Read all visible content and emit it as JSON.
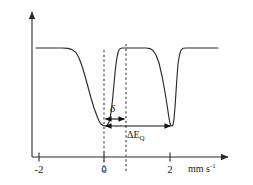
{
  "figure": {
    "background_color": "#ffffff",
    "line_color": "#2b2b2b"
  },
  "axes": {
    "x_axis": {
      "name": "velocity-axis",
      "unit_label_main": "mm s",
      "unit_label_exponent": "-1",
      "ticks": [
        {
          "value": -2,
          "label": "-2",
          "px": 39
        },
        {
          "value": 0,
          "label": "0",
          "px": 104
        },
        {
          "value": 2,
          "label": "2",
          "px": 170
        }
      ],
      "range": [
        -2.9,
        3.6
      ],
      "baseline_y_px": 157
    },
    "y_axis": {
      "name": "transmission-axis",
      "label": "",
      "ticks": [],
      "arrow": true,
      "x_px": 32,
      "top_y_px": 10
    }
  },
  "annotations": {
    "isomer_shift": {
      "symbol": "δ",
      "name": "isomer-shift",
      "arrow_from_px": 104,
      "arrow_to_px": 126,
      "arrow_y_px": 119,
      "label_x_px": 112,
      "label_y_px": 104
    },
    "quadrupole_splitting": {
      "symbol_main": "ΔE",
      "symbol_sub": "Q",
      "name": "quadrupole-splitting",
      "arrow_from_px": 104,
      "arrow_to_px": 172,
      "arrow_y_px": 126,
      "label_x_px": 128,
      "label_y_px": 131
    },
    "guide_lines": [
      {
        "name": "guide-line-zero",
        "x_px": 104,
        "top_y_px": 50,
        "bottom_y_px": 172
      },
      {
        "name": "guide-line-centroid",
        "x_px": 126,
        "top_y_px": 44,
        "bottom_y_px": 172
      }
    ]
  },
  "chart_data": {
    "type": "line",
    "xlabel": "mm s-1",
    "ylabel": "",
    "xlim": [
      -2.9,
      3.6
    ],
    "ylim": [
      0,
      1
    ],
    "grid": false,
    "legend": null,
    "series": [
      {
        "name": "transmission",
        "baseline_level": 1.0,
        "peaks": [
          {
            "name": "left-absorption-line",
            "center_mm_s": -0.05,
            "depth": 0.72,
            "width_mm_s": 0.62
          },
          {
            "name": "right-absorption-line",
            "center_mm_s": 2.0,
            "depth": 0.72,
            "width_mm_s": 0.36
          }
        ],
        "points_px": [
          [
            36,
            48
          ],
          [
            52,
            48
          ],
          [
            62,
            48
          ],
          [
            68,
            48.4
          ],
          [
            72,
            49.6
          ],
          [
            76,
            52.5
          ],
          [
            79,
            58
          ],
          [
            82,
            66
          ],
          [
            85,
            76
          ],
          [
            88,
            87
          ],
          [
            91,
            98
          ],
          [
            94,
            108
          ],
          [
            97,
            116
          ],
          [
            99,
            121
          ],
          [
            101,
            124
          ],
          [
            103,
            125.5
          ],
          [
            105,
            126
          ],
          [
            107,
            125.5
          ],
          [
            109,
            122
          ],
          [
            111,
            113
          ],
          [
            112.5,
            100
          ],
          [
            114,
            84
          ],
          [
            115.5,
            68
          ],
          [
            117,
            57
          ],
          [
            118.5,
            51
          ],
          [
            120,
            48.8
          ],
          [
            122,
            48
          ],
          [
            126,
            48
          ],
          [
            140,
            48
          ],
          [
            146,
            48
          ],
          [
            150,
            48.6
          ],
          [
            153,
            50.6
          ],
          [
            156,
            55
          ],
          [
            159,
            63
          ],
          [
            162,
            76
          ],
          [
            165,
            92
          ],
          [
            167.5,
            108
          ],
          [
            169,
            118
          ],
          [
            170,
            123.5
          ],
          [
            171,
            125.8
          ],
          [
            172,
            126
          ],
          [
            173,
            125
          ],
          [
            174,
            119
          ],
          [
            175,
            107
          ],
          [
            176,
            92
          ],
          [
            177,
            77
          ],
          [
            178,
            64
          ],
          [
            179.5,
            55
          ],
          [
            181,
            50.2
          ],
          [
            183,
            48.3
          ],
          [
            186,
            48
          ],
          [
            200,
            48
          ],
          [
            218,
            48
          ]
        ]
      }
    ]
  }
}
